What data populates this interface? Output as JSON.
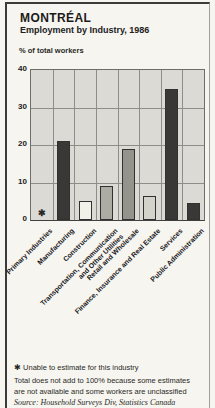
{
  "header": {
    "title": "MONTRÉAL",
    "subtitle": "Employment by Industry, 1986",
    "y_axis_title": "% of total workers"
  },
  "chart_data": {
    "type": "bar",
    "ylabel": "% of total workers",
    "ylim": [
      0,
      40
    ],
    "yticks": [
      0,
      10,
      20,
      30,
      40
    ],
    "grid": true,
    "categories": [
      "Primary Industries",
      "Manufacturing",
      "Construction",
      "Transportation, Communication and Other Utilities",
      "Retail and Wholesale",
      "Finance, Insurance and Real Estate",
      "Services",
      "Public Administration"
    ],
    "label_lines": [
      [
        "Primary Industries"
      ],
      [
        "Manufacturing"
      ],
      [
        "Construction"
      ],
      [
        "Transportation, Communication",
        "and Other Utilities"
      ],
      [
        "Retail and Wholesale"
      ],
      [
        "Finance, Insurance and Real Estate"
      ],
      [
        "Services"
      ],
      [
        "Public Administration"
      ]
    ],
    "values": [
      null,
      21,
      5,
      9,
      19,
      6.5,
      35,
      4.5
    ],
    "bar_colors": [
      null,
      "#393836",
      "#f2f1e9",
      "#adaca4",
      "#94938c",
      "#d4d3cb",
      "#393836",
      "#393836"
    ],
    "no_data_marker": "✱",
    "plot_background": "#dbdad4",
    "grid_color": "#8e8d88"
  },
  "footnotes": {
    "note1": "✱ Unable to estimate for this industry",
    "note2": "Total does not add to 100% because some estimates are not available and some workers are unclassified",
    "source": "Source: Household Surveys Div, Statistics Canada"
  }
}
